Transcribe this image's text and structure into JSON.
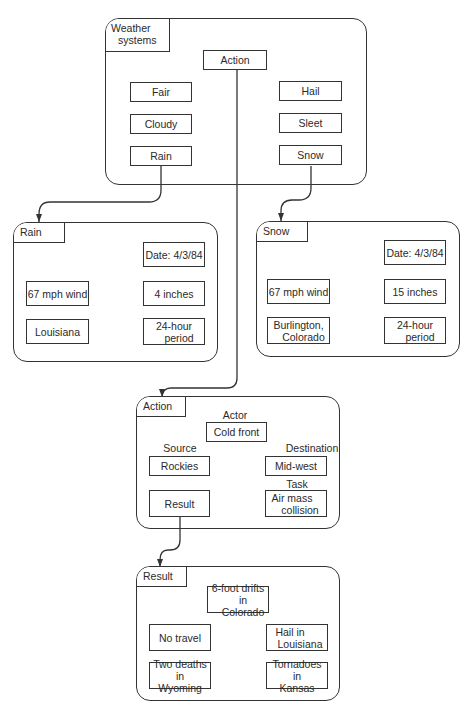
{
  "weather_systems": {
    "title_line1": "Weather",
    "title_line2": "systems",
    "action": "Action",
    "left_items": [
      "Fair",
      "Cloudy",
      "Rain"
    ],
    "right_items": [
      "Hail",
      "Sleet",
      "Snow"
    ]
  },
  "rain": {
    "title": "Rain",
    "date": "Date:  4/3/84",
    "wind": "67 mph wind",
    "amount": "4 inches",
    "location": "Louisiana",
    "period_line1": "24-hour",
    "period_line2": "period"
  },
  "snow": {
    "title": "Snow",
    "date": "Date:  4/3/84",
    "wind": "67 mph wind",
    "amount": "15 inches",
    "location_line1": "Burlington,",
    "location_line2": "Colorado",
    "period_line1": "24-hour",
    "period_line2": "period"
  },
  "action": {
    "title": "Action",
    "actor_label": "Actor",
    "actor": "Cold front",
    "source_label": "Source",
    "source": "Rockies",
    "destination_label": "Destination",
    "destination": "Mid-west",
    "task_label": "Task",
    "task_line1": "Air mass",
    "task_line2": "collision",
    "result": "Result"
  },
  "result": {
    "title": "Result",
    "drifts_line1": "6-foot drifts",
    "drifts_line2": "in Colorado",
    "no_travel": "No travel",
    "hail_line1": "Hail in",
    "hail_line2": "Louisiana",
    "deaths_line1": "Two deaths in",
    "deaths_line2": "Wyoming",
    "tornadoes_line1": "Tornadoes in",
    "tornadoes_line2": "Kansas"
  }
}
